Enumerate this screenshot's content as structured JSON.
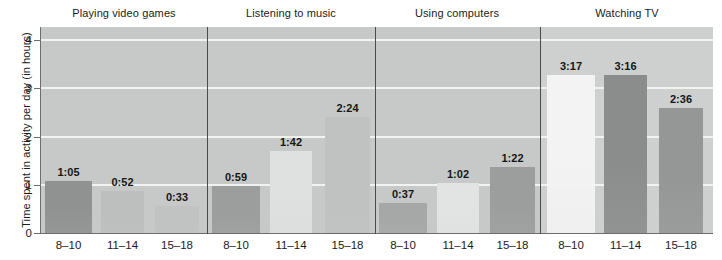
{
  "chart_data": {
    "type": "bar",
    "title": "",
    "xlabel": "",
    "ylabel": "Time spent in activity per day (in hours)",
    "ylim": [
      0,
      4.3
    ],
    "yticks": [
      0,
      1,
      2,
      3,
      4
    ],
    "ytick_labels": [
      "0",
      "1",
      "2",
      "3",
      "4"
    ],
    "grid": true,
    "legend": "none",
    "categories": [
      "8–10",
      "11–14",
      "15–18"
    ],
    "group_label_name": "Age group (years)",
    "value_format": "h:mm",
    "groups": [
      {
        "name": "Playing video games",
        "bars": [
          {
            "category": "8–10",
            "label": "1:05",
            "hours": 1.083
          },
          {
            "category": "11–14",
            "label": "0:52",
            "hours": 0.867
          },
          {
            "category": "15–18",
            "label": "0:33",
            "hours": 0.55
          }
        ]
      },
      {
        "name": "Listening to music",
        "bars": [
          {
            "category": "8–10",
            "label": "0:59",
            "hours": 0.983
          },
          {
            "category": "11–14",
            "label": "1:42",
            "hours": 1.7
          },
          {
            "category": "15–18",
            "label": "2:24",
            "hours": 2.4
          }
        ]
      },
      {
        "name": "Using computers",
        "bars": [
          {
            "category": "8–10",
            "label": "0:37",
            "hours": 0.617
          },
          {
            "category": "11–14",
            "label": "1:02",
            "hours": 1.033
          },
          {
            "category": "15–18",
            "label": "1:22",
            "hours": 1.367
          }
        ]
      },
      {
        "name": "Watching TV",
        "bars": [
          {
            "category": "8–10",
            "label": "3:17",
            "hours": 3.283
          },
          {
            "category": "11–14",
            "label": "3:16",
            "hours": 3.267
          },
          {
            "category": "15–18",
            "label": "2:36",
            "hours": 2.6
          }
        ]
      }
    ],
    "colors": {
      "plot_background": "#c6c9c8",
      "plot_background_light": "#cdd0cf",
      "gridline": "#f4f5f4",
      "axis": "#6e6e6e",
      "divider": "#4a4a4a",
      "text": "#1b1b1b",
      "bar_dark": "#8a8d8c",
      "bar_mid": "#b4b7b6",
      "bar_light": "#dcdedd",
      "bar_white": "#f2f3f2"
    }
  },
  "layout": {
    "plot": {
      "left": 41,
      "top": 27,
      "width": 672,
      "height": 206,
      "baseline_y": 233
    },
    "y_unit_px": 48.25,
    "dividers_x": [
      207,
      375,
      540
    ],
    "group_centers_x": [
      124,
      291,
      457,
      627
    ],
    "bar_geometry": [
      [
        {
          "x": 45,
          "w": 47
        },
        {
          "x": 101,
          "w": 43
        },
        {
          "x": 155,
          "w": 44
        }
      ],
      [
        {
          "x": 212,
          "w": 48
        },
        {
          "x": 270,
          "w": 42
        },
        {
          "x": 325,
          "w": 45
        }
      ],
      [
        {
          "x": 379,
          "w": 48
        },
        {
          "x": 437,
          "w": 42
        },
        {
          "x": 490,
          "w": 45
        }
      ],
      [
        {
          "x": 547,
          "w": 48
        },
        {
          "x": 604,
          "w": 43
        },
        {
          "x": 659,
          "w": 44
        }
      ]
    ],
    "bar_shades": [
      [
        "#8f9291",
        "#bcbfbe",
        "#c0c3c2"
      ],
      [
        "#9b9e9d",
        "#dfe1e0",
        "#bfc2c1"
      ],
      [
        "#a5a8a7",
        "#e2e4e3",
        "#9b9e9d"
      ],
      [
        "#f2f3f2",
        "#8a8d8c",
        "#949796"
      ]
    ]
  }
}
